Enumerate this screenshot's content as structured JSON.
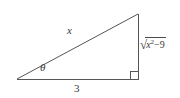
{
  "figure": {
    "type": "right-triangle-diagram",
    "background_color": "#ffffff",
    "stroke_color": "#555555",
    "text_color": "#3a3a3a",
    "geometry": {
      "left_vertex": [
        17,
        79
      ],
      "apex_vertex": [
        138,
        14
      ],
      "right_vertex": [
        138,
        79
      ],
      "right_angle_marker": {
        "x": 130,
        "y": 71,
        "size": 8
      }
    },
    "labels": {
      "hypotenuse": "x",
      "angle": "θ",
      "base": "3",
      "opposite_radical_sign": "√",
      "opposite_variable": "x",
      "opposite_exponent": "2",
      "opposite_operator": "−",
      "opposite_number": "9"
    }
  }
}
